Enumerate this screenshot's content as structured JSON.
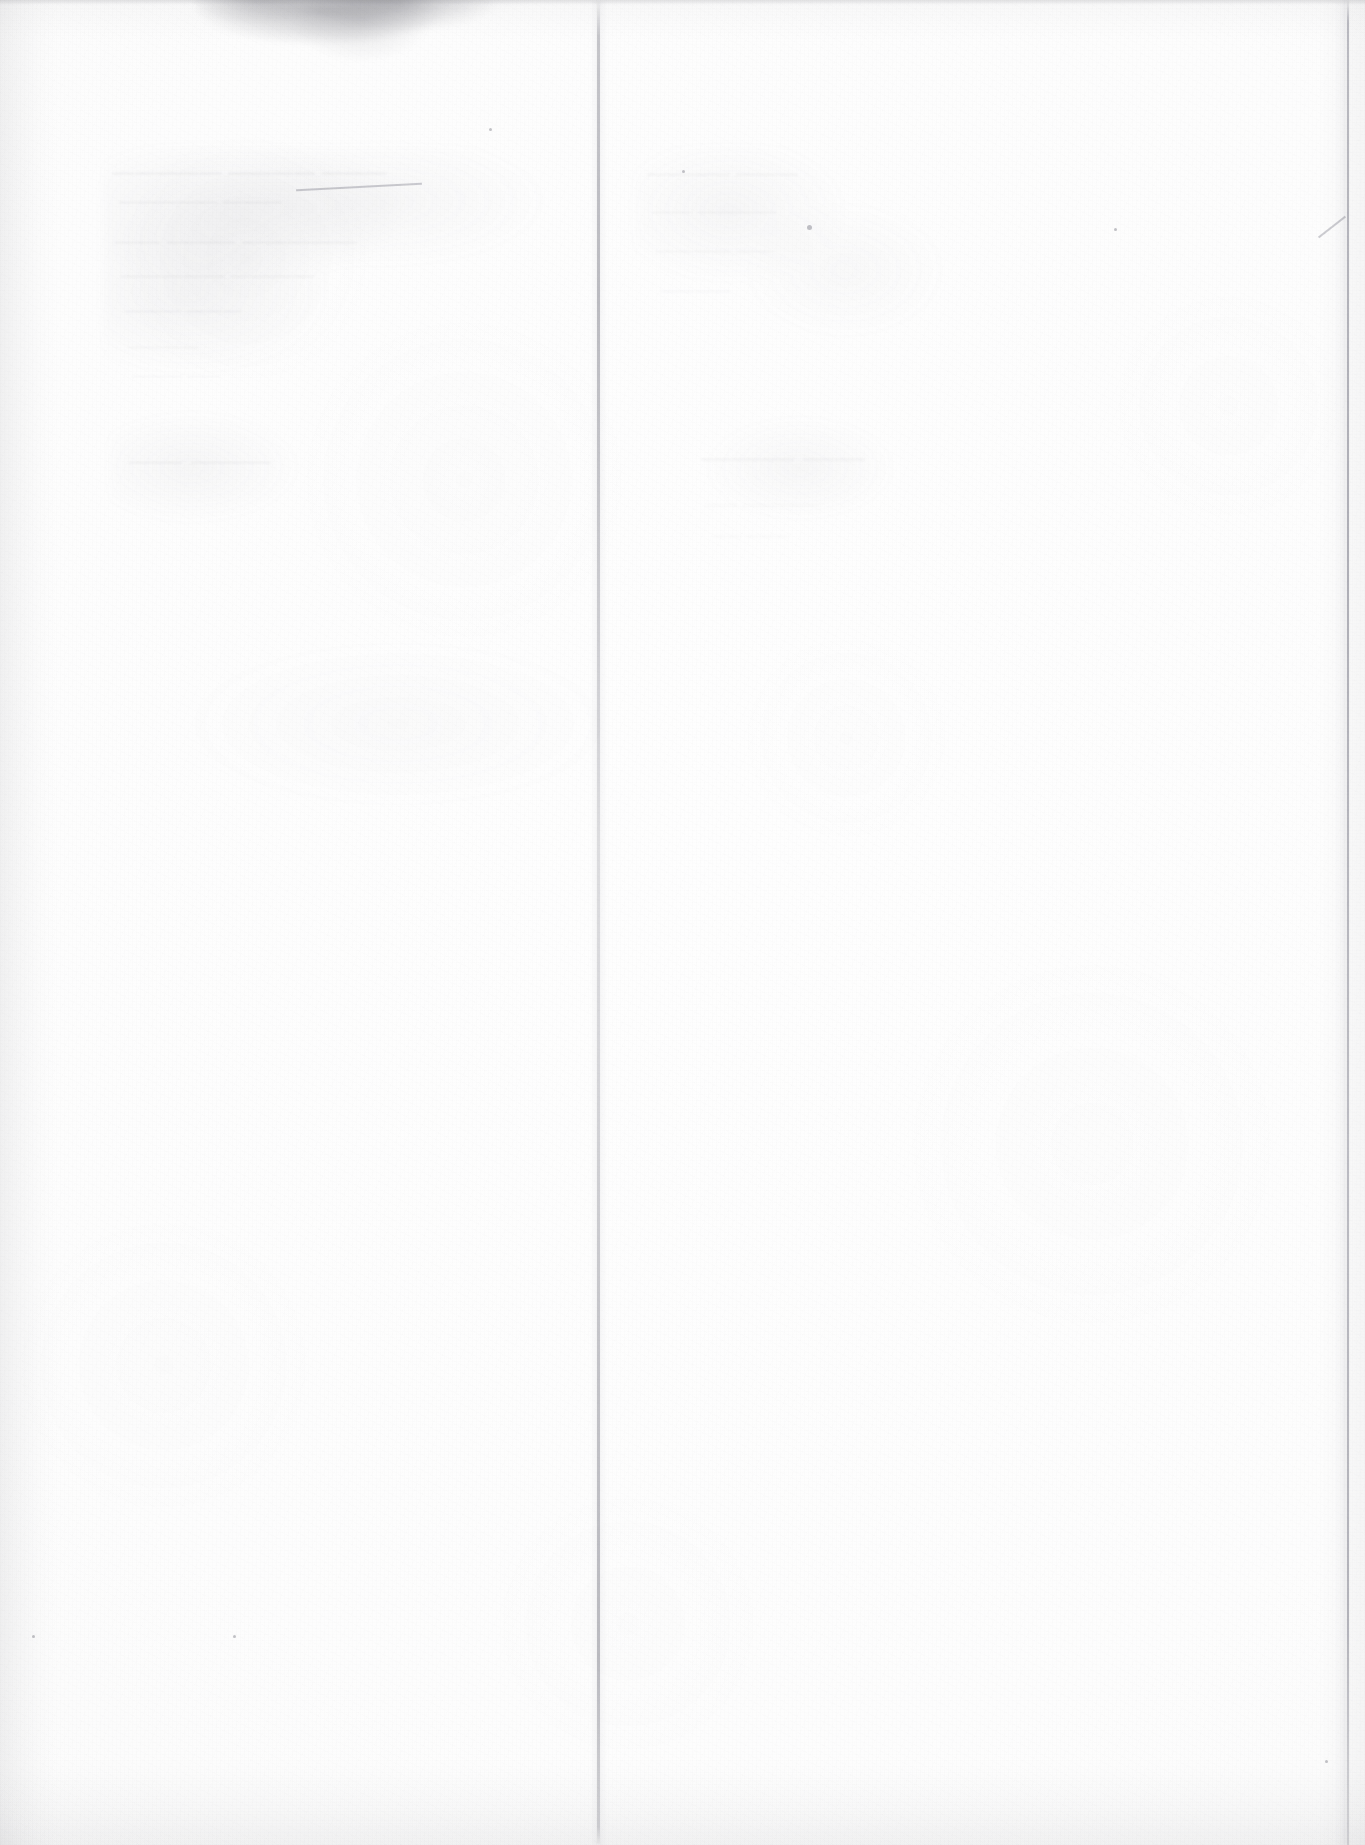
{
  "document": {
    "kind": "scanned-page",
    "surface": "blank verso (reverse side of leaf)",
    "visible_text": "",
    "page_number_label": "",
    "caption": "",
    "notes": "No legible printed or handwritten text is rendered on this surface; only paper texture, a vertical centre crease, edge shading, a grey smudge along the top edge, and faint mirrored show-through ink from the opposite side of the sheet."
  },
  "colors": {
    "paper": "#fdfdfd",
    "paper_highlight": "#fefefe",
    "paper_shadow": "#f6f6f6",
    "crease_line": "#aaaab2",
    "page_edge_line": "#9e9ea8",
    "smudge": "#6e6e76",
    "showthrough_ink": "#70707a",
    "page_background": "#ffffff"
  },
  "features": [
    {
      "name": "top-edge-smudge",
      "label": "grey dirt smudge along top edge",
      "x": 196,
      "y": -14,
      "w": 300,
      "h": 76
    },
    {
      "name": "centre-fold-crease",
      "label": "vertical fold crease",
      "x": 597,
      "y": 0,
      "w": 3,
      "h": 1845
    },
    {
      "name": "right-page-edge",
      "label": "right edge of the sheet",
      "x": 1347,
      "y": 0,
      "w": 2,
      "h": 1845
    },
    {
      "name": "left-edge-vignette",
      "label": "soft shadow along left margin",
      "x": 0,
      "y": 0,
      "w": 56,
      "h": 1845
    },
    {
      "name": "bottom-edge-vignette",
      "label": "soft shadow along bottom margin",
      "x": 0,
      "y": 1765,
      "w": 1365,
      "h": 80
    },
    {
      "name": "showthrough-upper-left",
      "label": "faint mirrored bleed-through text, upper left",
      "x": 110,
      "y": 150,
      "w": 480,
      "h": 350
    },
    {
      "name": "showthrough-upper-right",
      "label": "faint mirrored bleed-through text, upper right",
      "x": 640,
      "y": 150,
      "w": 330,
      "h": 380
    }
  ],
  "showthrough": {
    "description": "Illegible mirrored ink bleeding through from the printed recto.",
    "left_column_lines": [
      {
        "text": "———  ————  —————",
        "x": 112,
        "y": 160,
        "size": 21,
        "opacity": 0.13
      },
      {
        "text": "———   —————",
        "x": 118,
        "y": 190,
        "size": 19,
        "opacity": 0.12
      },
      {
        "text": "—————  ———  ——",
        "x": 114,
        "y": 228,
        "size": 22,
        "opacity": 0.12
      },
      {
        "text": "————   —————",
        "x": 120,
        "y": 264,
        "size": 20,
        "opacity": 0.11
      },
      {
        "text": "———  ———",
        "x": 124,
        "y": 300,
        "size": 18,
        "opacity": 0.1
      },
      {
        "text": "————",
        "x": 128,
        "y": 336,
        "size": 17,
        "opacity": 0.09
      },
      {
        "text": "——  ———",
        "x": 132,
        "y": 366,
        "size": 16,
        "opacity": 0.08
      },
      {
        "text": "———   ——",
        "x": 128,
        "y": 446,
        "size": 26,
        "opacity": 0.1
      }
    ],
    "right_column_lines": [
      {
        "text": "———   ————",
        "x": 646,
        "y": 162,
        "size": 20,
        "opacity": 0.1
      },
      {
        "text": "————  ——",
        "x": 652,
        "y": 200,
        "size": 19,
        "opacity": 0.09
      },
      {
        "text": "——  ————",
        "x": 656,
        "y": 240,
        "size": 18,
        "opacity": 0.08
      },
      {
        "text": "————",
        "x": 660,
        "y": 280,
        "size": 17,
        "opacity": 0.07
      },
      {
        "text": "——   ———",
        "x": 700,
        "y": 440,
        "size": 30,
        "opacity": 0.09
      },
      {
        "text": "—————  ——",
        "x": 706,
        "y": 496,
        "size": 15,
        "opacity": 0.07
      },
      {
        "text": "———  ——",
        "x": 712,
        "y": 528,
        "size": 14,
        "opacity": 0.06
      }
    ]
  },
  "marks": {
    "specks": [
      {
        "name": "speck-top-right",
        "x": 1114,
        "y": 228,
        "d": 3
      },
      {
        "name": "speck-mid-left",
        "x": 489,
        "y": 128,
        "d": 3
      },
      {
        "name": "speck-upper-centre",
        "x": 807,
        "y": 225,
        "d": 5
      },
      {
        "name": "speck-lower-left",
        "x": 233,
        "y": 1635,
        "d": 3
      },
      {
        "name": "speck-bottom-right",
        "x": 1325,
        "y": 1760,
        "d": 3
      },
      {
        "name": "speck-mid-right",
        "x": 682,
        "y": 170,
        "d": 3
      },
      {
        "name": "speck-left-band",
        "x": 32,
        "y": 1635,
        "d": 3
      }
    ],
    "pencil_strokes": [
      {
        "name": "pencil-stroke-right-edge",
        "x": 1315,
        "y": 226,
        "w": 34,
        "h": 2,
        "rotate": -38
      },
      {
        "name": "pencil-stroke-top-dash",
        "x": 296,
        "y": 186,
        "w": 126,
        "h": 2,
        "rotate": -3
      }
    ]
  }
}
